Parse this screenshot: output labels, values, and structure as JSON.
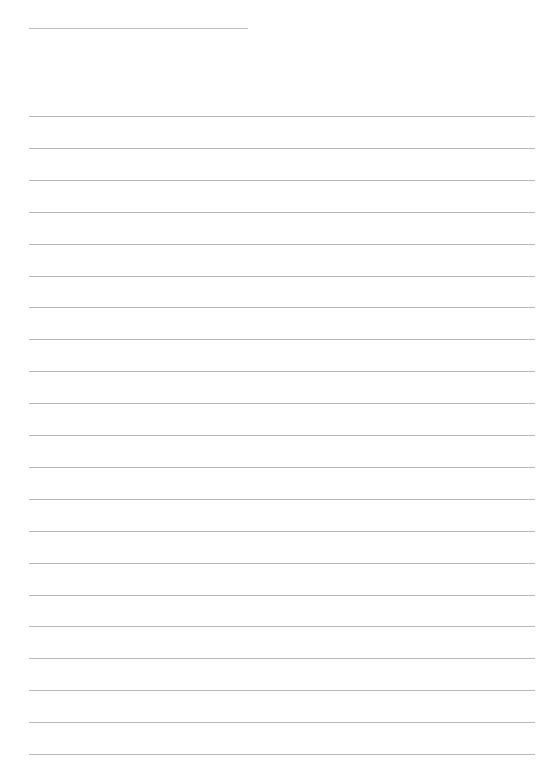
{
  "document": {
    "type": "lined-paper",
    "background_color": "#ffffff",
    "line_color": "#b9b9b9",
    "header_rule": {
      "left": 29,
      "top": 28,
      "width": 219
    },
    "body_rules": {
      "left": 29,
      "width": 506,
      "first_top": 116,
      "spacing": 31.9,
      "count": 21
    }
  }
}
